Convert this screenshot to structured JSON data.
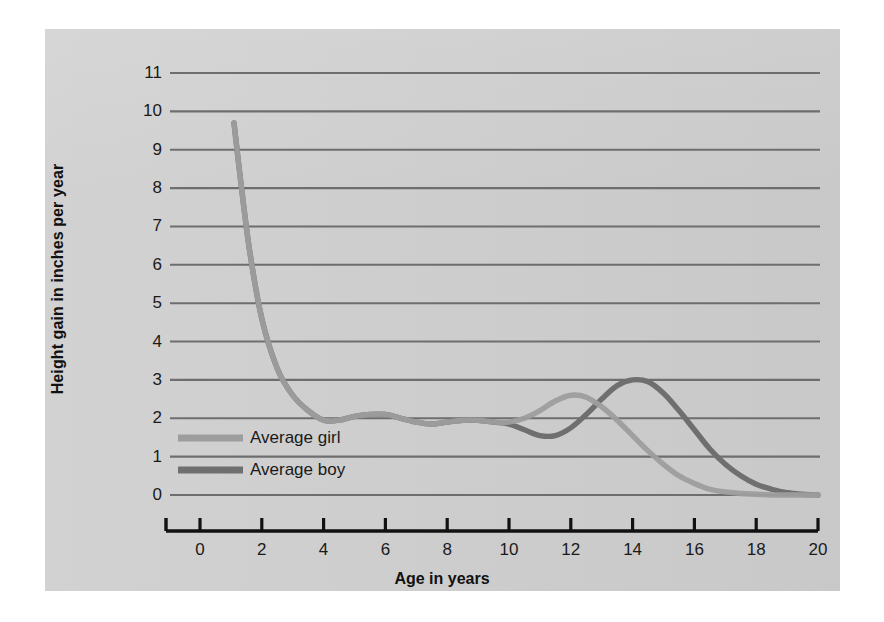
{
  "figure": {
    "background_color": "#ffffff",
    "panel_color": "#cfcfcf",
    "gridline_color": "#6e6e6e",
    "axis_color": "#111111"
  },
  "axes": {
    "ylabel": "Height gain in inches per year",
    "xlabel": "Age in years",
    "yticks": [
      "0",
      "1",
      "2",
      "3",
      "4",
      "5",
      "6",
      "7",
      "8",
      "9",
      "10",
      "11"
    ],
    "xticks": [
      "0",
      "2",
      "4",
      "6",
      "8",
      "10",
      "12",
      "14",
      "16",
      "18",
      "20"
    ]
  },
  "legend": {
    "position": "inside-lower-left",
    "entries": [
      {
        "label": "Average girl",
        "color": "#9d9d9d"
      },
      {
        "label": "Average boy",
        "color": "#6f6f6f"
      }
    ]
  },
  "chart_data": {
    "type": "line",
    "title": "",
    "xlabel": "Age in years",
    "ylabel": "Height gain in inches per year",
    "xlim": [
      0,
      20
    ],
    "ylim": [
      0,
      11
    ],
    "grid": "horizontal",
    "x": [
      1.1,
      1.3,
      1.6,
      2.0,
      2.5,
      3.0,
      3.5,
      4.0,
      4.5,
      5.0,
      5.5,
      6.0,
      6.5,
      7.0,
      7.5,
      8.0,
      8.5,
      9.0,
      9.5,
      10.0,
      10.5,
      11.0,
      11.5,
      12.0,
      12.5,
      13.0,
      13.5,
      14.0,
      14.5,
      15.0,
      15.5,
      16.0,
      16.5,
      17.0,
      17.5,
      18.0,
      18.5,
      19.0,
      19.5,
      20.0
    ],
    "series": [
      {
        "name": "Average girl",
        "color": "#9d9d9d",
        "peak_age": 12.0,
        "peak_value": 2.6,
        "values": [
          9.7,
          8.3,
          6.4,
          4.6,
          3.3,
          2.6,
          2.2,
          1.95,
          1.95,
          2.05,
          2.1,
          2.1,
          2.0,
          1.9,
          1.85,
          1.9,
          1.95,
          1.95,
          1.9,
          1.9,
          2.0,
          2.2,
          2.45,
          2.6,
          2.55,
          2.3,
          1.95,
          1.55,
          1.15,
          0.8,
          0.5,
          0.3,
          0.15,
          0.08,
          0.04,
          0.02,
          0.0,
          0.0,
          0.0,
          0.0
        ]
      },
      {
        "name": "Average boy",
        "color": "#6f6f6f",
        "peak_age": 14.2,
        "peak_value": 3.0,
        "values": [
          9.7,
          8.3,
          6.4,
          4.6,
          3.3,
          2.6,
          2.2,
          1.95,
          1.95,
          2.05,
          2.1,
          2.1,
          2.0,
          1.9,
          1.85,
          1.9,
          1.95,
          1.95,
          1.9,
          1.85,
          1.7,
          1.55,
          1.55,
          1.75,
          2.1,
          2.5,
          2.85,
          3.0,
          2.95,
          2.65,
          2.2,
          1.7,
          1.2,
          0.8,
          0.5,
          0.28,
          0.15,
          0.06,
          0.02,
          0.0
        ]
      }
    ],
    "annotations": [
      "Both curves coincide from birth through about age 10",
      "Girl pubertal spurt peaks near age 12 at about 2.6 in/yr",
      "Boy pubertal spurt peaks near age 14 at about 3.0 in/yr"
    ]
  }
}
